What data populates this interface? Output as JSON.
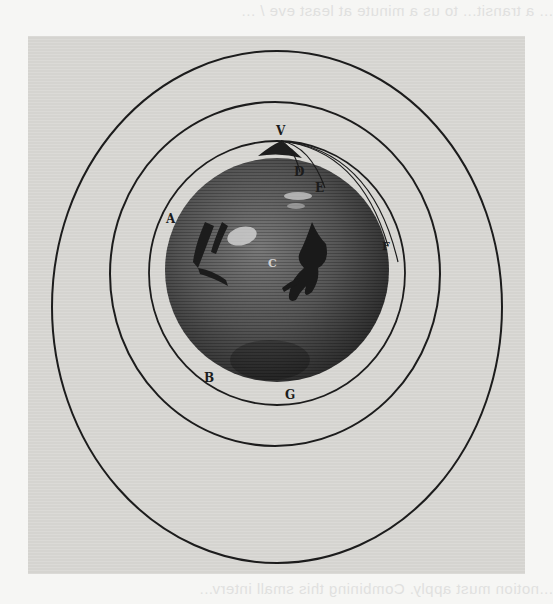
{
  "figure": {
    "colors": {
      "page_background": "#f6f6f4",
      "plate_background": "#d9d8d4",
      "line_color": "#1c1c1c",
      "globe_dark": "#3a3a3a",
      "globe_mid": "#6a6a6a"
    },
    "labels": [
      {
        "id": "V",
        "text": "V",
        "x": 276,
        "y": 125,
        "meaning": "mountain top launch point"
      },
      {
        "id": "D",
        "text": "D",
        "x": 294,
        "y": 166,
        "meaning": "first landing point"
      },
      {
        "id": "E",
        "text": "E",
        "x": 315,
        "y": 182,
        "meaning": "second landing point"
      },
      {
        "id": "F",
        "text": "F",
        "x": 382,
        "y": 241,
        "meaning": "third landing point"
      },
      {
        "id": "A",
        "text": "A",
        "x": 166,
        "y": 213,
        "meaning": "point on far orbit"
      },
      {
        "id": "B",
        "text": "B",
        "x": 204,
        "y": 372,
        "meaning": "point on lower orbit"
      },
      {
        "id": "G",
        "text": "G",
        "x": 285,
        "y": 389,
        "meaning": "point at bottom of orbit"
      },
      {
        "id": "C",
        "text": "C",
        "x": 268,
        "y": 258,
        "meaning": "centre of the Earth"
      }
    ],
    "orbits": [
      {
        "name": "outer-orbit",
        "cx": 277,
        "cy": 307,
        "rx": 225,
        "ry": 256
      },
      {
        "name": "middle-orbit",
        "cx": 275,
        "cy": 274,
        "rx": 165,
        "ry": 172
      },
      {
        "name": "inner-orbit",
        "cx": 277,
        "cy": 273,
        "rx": 128,
        "ry": 132
      }
    ],
    "globe": {
      "cx": 277,
      "cy": 270,
      "r": 114
    },
    "bleed_through": {
      "top": "... a transit... to us a minute at least eve / ...",
      "bottom": "...notion must apply. Combining this small interv..."
    }
  }
}
